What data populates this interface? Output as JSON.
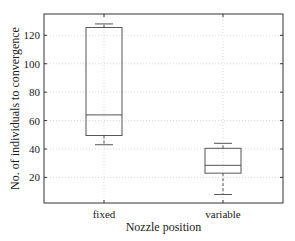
{
  "chart_data": {
    "type": "box",
    "title": "",
    "xlabel": "Nozzle position",
    "ylabel": "No. of individuals to convergence",
    "categories": [
      "fixed",
      "variable"
    ],
    "boxes": [
      {
        "label": "fixed",
        "whisker_low": 43,
        "q1": 49.5,
        "median": 64,
        "q3": 125.5,
        "whisker_high": 128
      },
      {
        "label": "variable",
        "whisker_low": 8,
        "q1": 23,
        "median": 28.5,
        "q3": 40.5,
        "whisker_high": 44
      }
    ],
    "yticks": [
      20,
      40,
      60,
      80,
      100,
      120
    ],
    "ytick_labels": [
      "20",
      "40",
      "60",
      "80",
      "100",
      "120"
    ],
    "ylim": [
      2,
      135
    ],
    "grid": true,
    "legend": null
  },
  "axes": {
    "xlabel": "Nozzle position",
    "ylabel": "No. of individuals to convergence",
    "xtick_labels": [
      "fixed",
      "variable"
    ],
    "ytick_labels": [
      "20",
      "40",
      "60",
      "80",
      "100",
      "120"
    ]
  },
  "colors": {
    "axis": "#333333",
    "box": "#555555",
    "grid": "#d9d9d9",
    "text": "#1a1a1a"
  }
}
